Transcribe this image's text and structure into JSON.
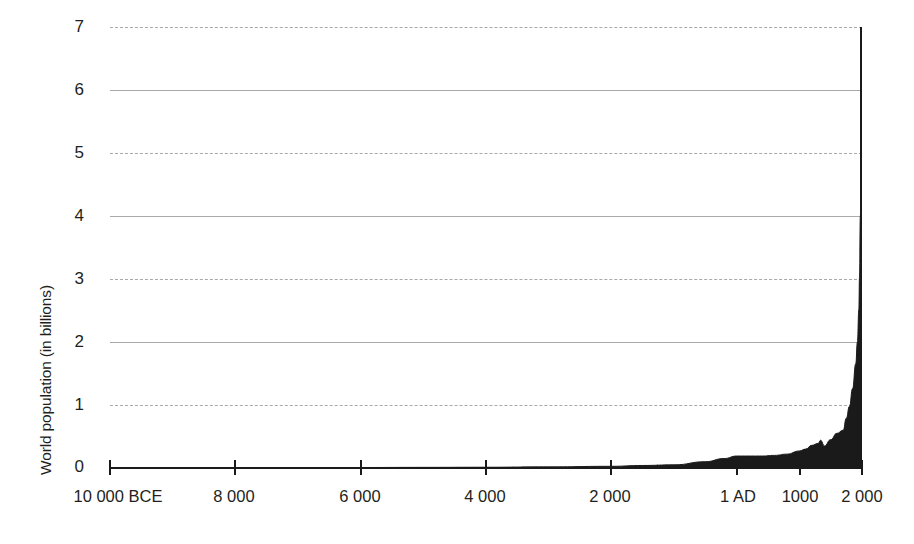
{
  "chart_data": {
    "type": "area",
    "title": "",
    "xlabel": "",
    "ylabel": "World population (in billions)",
    "grid": true,
    "legend": false,
    "xlim": [
      -10000,
      2000
    ],
    "ylim": [
      0,
      7
    ],
    "y_ticks": [
      {
        "value": 7,
        "label": "7",
        "gridline": "dashed"
      },
      {
        "value": 6,
        "label": "6",
        "gridline": "solid"
      },
      {
        "value": 5,
        "label": "5",
        "gridline": "dashed"
      },
      {
        "value": 4,
        "label": "4",
        "gridline": "solid"
      },
      {
        "value": 3,
        "label": "3",
        "gridline": "dashed"
      },
      {
        "value": 2,
        "label": "2",
        "gridline": "solid"
      },
      {
        "value": 1,
        "label": "1",
        "gridline": "dashed"
      },
      {
        "value": 0,
        "label": "0",
        "gridline": "none"
      }
    ],
    "x_ticks": [
      {
        "value": -10000,
        "label": "10 000 BCE"
      },
      {
        "value": -8000,
        "label": "8 000"
      },
      {
        "value": -6000,
        "label": "6 000"
      },
      {
        "value": -4000,
        "label": "4 000"
      },
      {
        "value": -2000,
        "label": "2 000"
      },
      {
        "value": 1,
        "label": "1 AD"
      },
      {
        "value": 1000,
        "label": "1000"
      },
      {
        "value": 2000,
        "label": "2 000"
      }
    ],
    "series": [
      {
        "name": "World population",
        "color": "#1a1a1a",
        "fill": true,
        "x": [
          -10000,
          -9000,
          -8000,
          -7000,
          -6000,
          -5000,
          -4000,
          -3000,
          -2000,
          -1500,
          -1000,
          -500,
          -200,
          1,
          200,
          400,
          600,
          800,
          1000,
          1100,
          1200,
          1300,
          1340,
          1400,
          1500,
          1600,
          1700,
          1750,
          1800,
          1850,
          1900,
          1927,
          1950,
          1960,
          1974,
          1987,
          1999,
          2000
        ],
        "y": [
          0.004,
          0.005,
          0.006,
          0.007,
          0.008,
          0.01,
          0.012,
          0.018,
          0.027,
          0.04,
          0.05,
          0.1,
          0.15,
          0.19,
          0.19,
          0.19,
          0.2,
          0.22,
          0.27,
          0.3,
          0.36,
          0.39,
          0.44,
          0.35,
          0.45,
          0.55,
          0.6,
          0.79,
          0.98,
          1.26,
          1.65,
          2.0,
          2.52,
          3.02,
          4.0,
          5.0,
          6.0,
          6.1
        ]
      }
    ],
    "axis_colors": {
      "axis_line": "#1a1a1a",
      "gridline": "#a7a9ac",
      "area_fill": "#1a1a1a",
      "text": "#231f20",
      "background": "#ffffff"
    }
  }
}
